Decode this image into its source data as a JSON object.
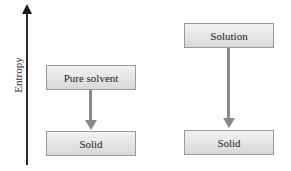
{
  "axis": {
    "label": "Entropy",
    "direction": "up"
  },
  "left_column": {
    "top_box": {
      "label": "Pure solvent"
    },
    "bottom_box": {
      "label": "Solid"
    }
  },
  "right_column": {
    "top_box": {
      "label": "Solution"
    },
    "bottom_box": {
      "label": "Solid"
    }
  },
  "colors": {
    "axis": "#2a2a2a",
    "arrow": "#8a8a8a",
    "box_border": "#9a9a9a",
    "box_fill_top": "#f2f2f2",
    "box_fill_bottom": "#d8d8d8"
  }
}
